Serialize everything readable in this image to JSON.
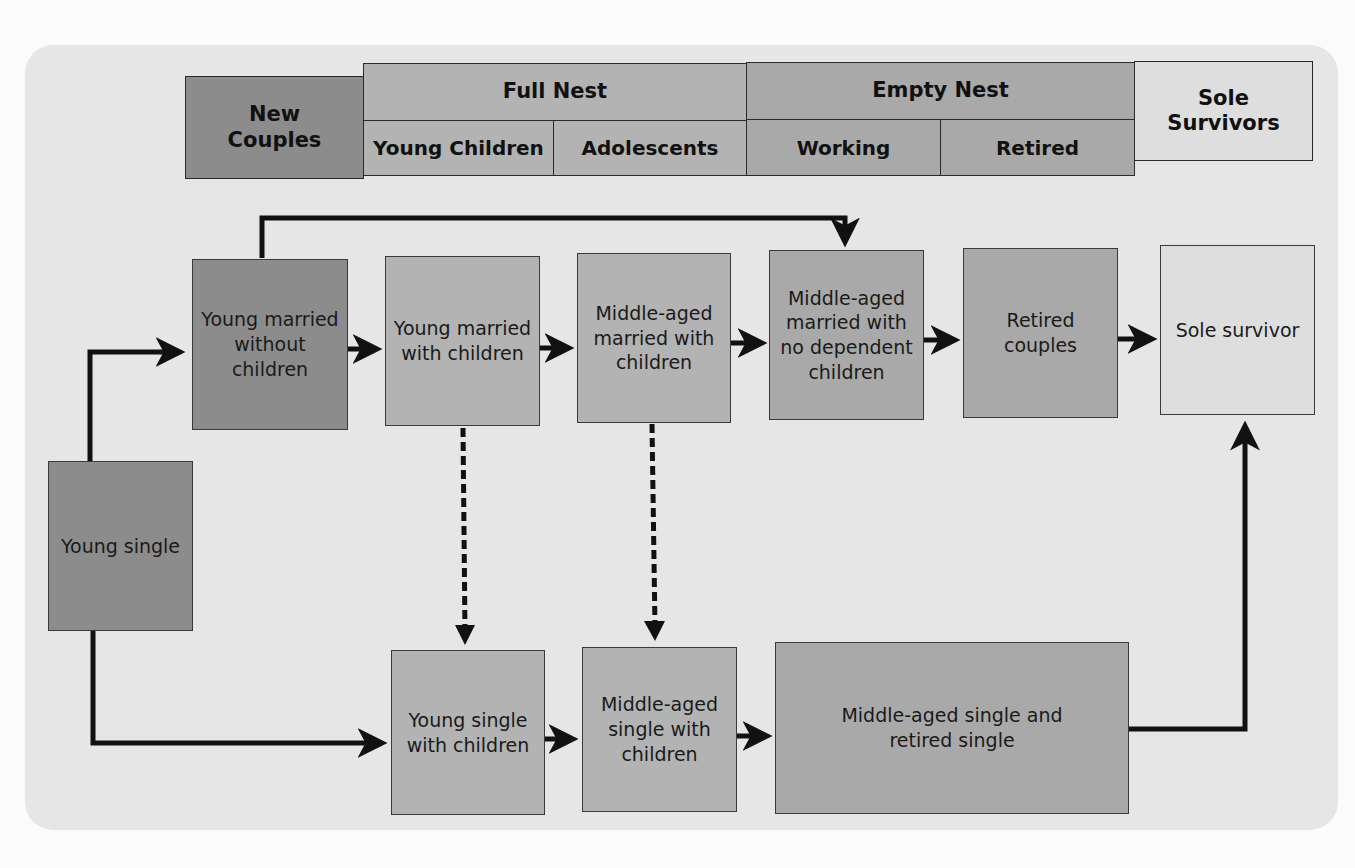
{
  "header": {
    "new_couples": "New\nCouples",
    "full_nest": {
      "label": "Full Nest",
      "young_children": "Young Children",
      "adolescents": "Adolescents"
    },
    "empty_nest": {
      "label": "Empty Nest",
      "working": "Working",
      "retired": "Retired"
    },
    "sole_survivors": "Sole\nSurvivors"
  },
  "nodes": {
    "young_single": "Young single",
    "young_married_without_children": "Young married without children",
    "young_married_with_children": "Young married with children",
    "middle_aged_married_with_children": "Middle-aged married with children",
    "middle_aged_married_no_dependent": "Middle-aged married with no dependent children",
    "retired_couples": "Retired couples",
    "sole_survivor": "Sole survivor",
    "young_single_with_children": "Young single with children",
    "middle_aged_single_with_children": "Middle-aged single with children",
    "middle_aged_and_retired_single": "Middle-aged single and retired single"
  },
  "colors": {
    "new_couples": "#8c8c8c",
    "full_nest": "#b3b3b3",
    "empty_nest": "#a9a9a9",
    "sole_survivors": "#dedede",
    "panel": "#e6e6e6",
    "arrows": "#111111"
  },
  "edges": [
    {
      "from": "young_single",
      "to": "young_married_without_children",
      "style": "solid"
    },
    {
      "from": "young_single",
      "to": "young_single_with_children",
      "style": "solid"
    },
    {
      "from": "young_married_without_children",
      "to": "young_married_with_children",
      "style": "solid"
    },
    {
      "from": "young_married_without_children",
      "to": "middle_aged_married_no_dependent",
      "style": "solid"
    },
    {
      "from": "young_married_with_children",
      "to": "middle_aged_married_with_children",
      "style": "solid"
    },
    {
      "from": "middle_aged_married_with_children",
      "to": "middle_aged_married_no_dependent",
      "style": "solid"
    },
    {
      "from": "middle_aged_married_no_dependent",
      "to": "retired_couples",
      "style": "solid"
    },
    {
      "from": "retired_couples",
      "to": "sole_survivor",
      "style": "solid"
    },
    {
      "from": "young_married_with_children",
      "to": "young_single_with_children",
      "style": "dashed"
    },
    {
      "from": "middle_aged_married_with_children",
      "to": "middle_aged_single_with_children",
      "style": "dashed"
    },
    {
      "from": "young_single_with_children",
      "to": "middle_aged_single_with_children",
      "style": "solid"
    },
    {
      "from": "middle_aged_single_with_children",
      "to": "middle_aged_and_retired_single",
      "style": "solid"
    },
    {
      "from": "middle_aged_and_retired_single",
      "to": "sole_survivor",
      "style": "solid"
    }
  ]
}
